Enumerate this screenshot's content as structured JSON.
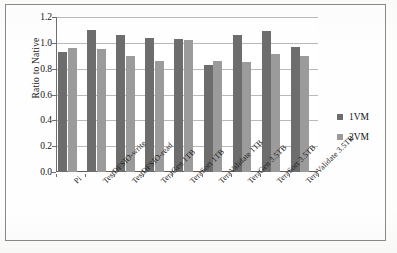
{
  "chart_data": {
    "type": "bar",
    "title": "",
    "xlabel": "",
    "ylabel": "Ratio to Native",
    "ylim": [
      0.0,
      1.2
    ],
    "ytick_labels": [
      "1.2",
      "1.0",
      "0.8",
      "0.6",
      "0.4",
      "0.2",
      "0.0"
    ],
    "ytick_values": [
      1.2,
      1.0,
      0.8,
      0.6,
      0.4,
      0.2,
      0.0
    ],
    "grid": true,
    "legend_position": "right",
    "categories": [
      "Pi",
      "TestDFSIO-write",
      "TestDFSIO-read",
      "TeraGen 1TB",
      "TeraSort 1TB",
      "TeraValidate 1TB",
      "TeraGen 3.5TB",
      "TeraSort 3.5TB",
      "TeraValidate 3.5TB"
    ],
    "series": [
      {
        "name": "1VM",
        "color": "#6d6d6d",
        "values": [
          0.93,
          1.1,
          1.06,
          1.04,
          1.03,
          0.83,
          1.06,
          1.09,
          0.97
        ]
      },
      {
        "name": "2VM",
        "color": "#9b9b9b",
        "values": [
          0.96,
          0.95,
          0.9,
          0.86,
          1.02,
          0.86,
          0.85,
          0.91,
          0.9
        ]
      }
    ]
  },
  "legend": {
    "entries": [
      {
        "label": "1VM",
        "color": "#6d6d6d"
      },
      {
        "label": "2VM",
        "color": "#9b9b9b"
      }
    ]
  }
}
